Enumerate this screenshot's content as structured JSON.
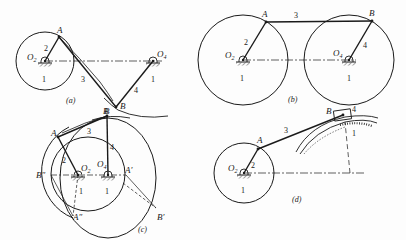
{
  "figure": {
    "colors": {
      "ink": "#1a1a1a",
      "paper": "#fdfdfd"
    },
    "panels": [
      {
        "id": "a",
        "caption": "(a)",
        "labels": {
          "A": "A",
          "B": "B",
          "B_curve": "B",
          "O2": "O",
          "O2_sub": "2",
          "O4": "O",
          "O4_sub": "4",
          "link2": "2",
          "link3": "3",
          "link4": "4",
          "ground_left": "1",
          "ground_right": "1"
        }
      },
      {
        "id": "b",
        "caption": "(b)",
        "labels": {
          "A": "A",
          "B": "B",
          "O2": "O",
          "O2_sub": "2",
          "O4": "O",
          "O4_sub": "4",
          "link2": "2",
          "link3": "3",
          "link4": "4",
          "ground_left": "1",
          "ground_right": "1"
        }
      },
      {
        "id": "c",
        "caption": "(c)",
        "labels": {
          "A": "A",
          "B": "B",
          "A_prime": "A′",
          "B_prime": "B′",
          "A_dprime": "A″",
          "B_dprime": "B″",
          "O2": "O",
          "O2_sub": "2",
          "O4": "O",
          "O4_sub": "4",
          "link2": "2",
          "link3": "3",
          "link4": "4",
          "ground_left": "1",
          "ground_right": "1"
        }
      },
      {
        "id": "d",
        "caption": "(d)",
        "labels": {
          "A": "A",
          "B": "B",
          "O2": "O",
          "O2_sub": "2",
          "link2": "2",
          "link3": "3",
          "link4": "4",
          "ground_left": "1",
          "ground_right": "1"
        }
      }
    ]
  }
}
